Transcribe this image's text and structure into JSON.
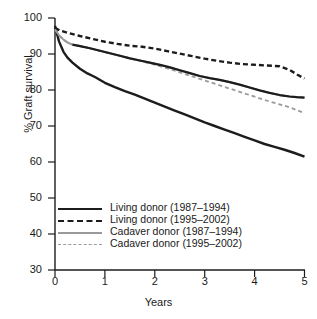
{
  "chart_data": {
    "type": "line",
    "title": "",
    "xlabel": "Years",
    "ylabel": "% Graft survival",
    "xlim": [
      0,
      5
    ],
    "ylim": [
      30,
      100
    ],
    "xticks": [
      0,
      1,
      2,
      3,
      4,
      5
    ],
    "yticks": [
      30,
      40,
      50,
      60,
      70,
      80,
      90,
      100
    ],
    "grid": false,
    "legend_position": "lower-left-inside",
    "series": [
      {
        "name": "Living donor (1987–1994)",
        "style": "solid",
        "color": "#1c1c1c",
        "width": 2.4,
        "x": [
          0,
          0.08,
          0.17,
          0.25,
          0.35,
          0.5,
          0.65,
          0.8,
          1.0,
          1.2,
          1.4,
          1.6,
          1.8,
          2.0,
          2.2,
          2.4,
          2.6,
          2.8,
          3.0,
          3.2,
          3.4,
          3.6,
          3.8,
          4.0,
          4.2,
          4.4,
          4.6,
          4.8,
          5.0
        ],
        "y": [
          97.8,
          93.5,
          90.6,
          89.0,
          87.6,
          85.9,
          84.6,
          83.6,
          82.0,
          80.8,
          79.7,
          78.7,
          77.6,
          76.5,
          75.4,
          74.3,
          73.2,
          72.1,
          71.0,
          70.0,
          69.0,
          68.0,
          67.0,
          66.0,
          65.0,
          64.2,
          63.4,
          62.5,
          61.5
        ]
      },
      {
        "name": "Living donor (1995–2002)",
        "style": "dashed",
        "color": "#1c1c1c",
        "width": 2.4,
        "x": [
          0,
          0.1,
          0.25,
          0.5,
          0.75,
          1.0,
          1.25,
          1.5,
          1.75,
          2.0,
          2.25,
          2.5,
          2.75,
          3.0,
          3.25,
          3.5,
          3.75,
          4.0,
          4.25,
          4.5,
          4.7,
          4.85,
          5.0
        ],
        "y": [
          97.3,
          96.5,
          95.9,
          95.0,
          94.2,
          93.4,
          92.8,
          92.3,
          92.0,
          91.5,
          90.8,
          90.1,
          89.4,
          88.7,
          88.1,
          87.6,
          87.2,
          87.0,
          86.8,
          86.6,
          85.6,
          84.3,
          83.2
        ]
      },
      {
        "name": "Cadaver donor (1987–1994)",
        "style": "solid",
        "color": "#9a9a9a",
        "width": 2.0,
        "x": [
          0,
          0.08,
          0.17,
          0.25,
          0.35,
          0.5,
          0.7,
          0.9,
          1.1,
          1.3,
          1.5,
          1.7,
          1.9,
          2.1,
          2.3,
          2.5,
          2.7,
          2.9,
          3.1,
          3.3,
          3.5,
          3.7,
          3.9,
          4.1,
          4.3,
          4.5,
          4.7,
          4.85,
          5.0
        ],
        "y": [
          96.8,
          95.2,
          94.0,
          93.2,
          92.6,
          92.2,
          91.6,
          90.9,
          90.2,
          89.5,
          88.8,
          88.2,
          87.6,
          87.0,
          86.3,
          85.5,
          84.7,
          83.9,
          83.3,
          82.8,
          82.2,
          81.5,
          80.7,
          79.9,
          79.2,
          78.6,
          78.2,
          78.0,
          77.9
        ]
      },
      {
        "name": "Cadaver donor (1995–2002)",
        "style": "dashed",
        "color": "#9a9a9a",
        "width": 1.8,
        "x": [
          0,
          0.08,
          0.17,
          0.25,
          0.35,
          0.5,
          0.7,
          0.9,
          1.1,
          1.3,
          1.5,
          1.7,
          1.9,
          2.1,
          2.3,
          2.5,
          2.7,
          2.9,
          3.1,
          3.3,
          3.5,
          3.7,
          3.9,
          4.1,
          4.3,
          4.5,
          4.7,
          4.85,
          5.0
        ],
        "y": [
          96.8,
          95.2,
          94.0,
          93.2,
          92.6,
          92.2,
          91.6,
          90.9,
          90.2,
          89.5,
          88.8,
          88.1,
          87.4,
          86.6,
          85.8,
          84.9,
          84.0,
          83.1,
          82.2,
          81.3,
          80.4,
          79.5,
          78.6,
          77.7,
          76.8,
          76.0,
          75.2,
          74.4,
          73.6
        ]
      },
      {
        "name": "Cadaver donor (1987–1994) dark overlay",
        "style": "solid",
        "color": "#1c1c1c",
        "width": 2.2,
        "x": [
          0.35,
          0.5,
          0.7,
          0.9,
          1.1,
          1.3,
          1.5,
          1.7,
          1.9,
          2.1,
          2.3,
          2.5,
          2.7,
          2.9,
          3.1,
          3.3,
          3.5,
          3.7,
          3.9,
          4.1,
          4.3,
          4.5,
          4.7,
          4.85,
          5.0
        ],
        "y": [
          92.6,
          92.2,
          91.6,
          90.9,
          90.2,
          89.5,
          88.8,
          88.2,
          87.6,
          87.0,
          86.3,
          85.5,
          84.7,
          83.9,
          83.3,
          82.8,
          82.2,
          81.5,
          80.7,
          79.9,
          79.2,
          78.6,
          78.2,
          78.0,
          77.9
        ]
      }
    ],
    "legend_entries": [
      {
        "label": "Living donor (1987–1994)",
        "style": "black-solid"
      },
      {
        "label": "Living donor (1995–2002)",
        "style": "black-dash"
      },
      {
        "label": "Cadaver donor (1987–1994)",
        "style": "gray-solid"
      },
      {
        "label": "Cadaver donor (1995–2002)",
        "style": "gray-dash"
      }
    ]
  },
  "axes": {
    "y_tick_labels": [
      "100",
      "90",
      "80",
      "70",
      "60",
      "50",
      "40",
      "30"
    ],
    "x_tick_labels": [
      "0",
      "1",
      "2",
      "3",
      "4",
      "5"
    ],
    "ylabel": "% Graft survival",
    "xlabel": "Years"
  }
}
